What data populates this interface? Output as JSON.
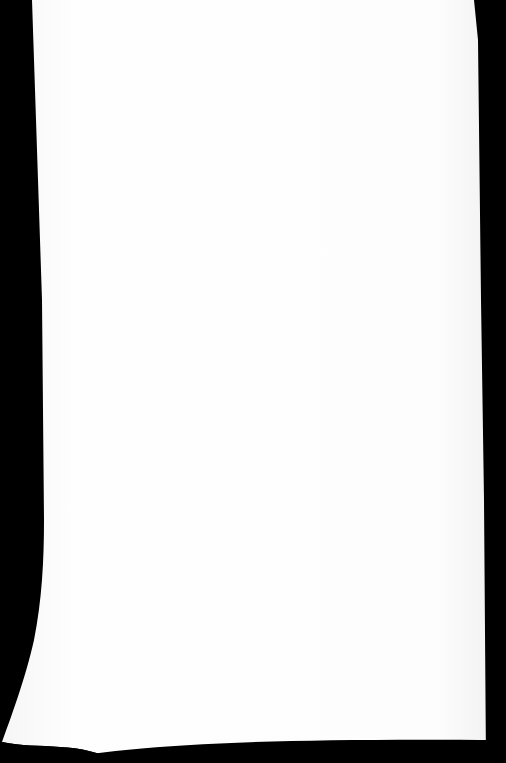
{
  "scene": {
    "description": "Photograph of a blank white sheet of paper on a black background with a curled bottom-left corner",
    "background_color": "#000000",
    "paper_color": "#fdfdfd",
    "paper_edge_color": "#f2f2f2"
  }
}
